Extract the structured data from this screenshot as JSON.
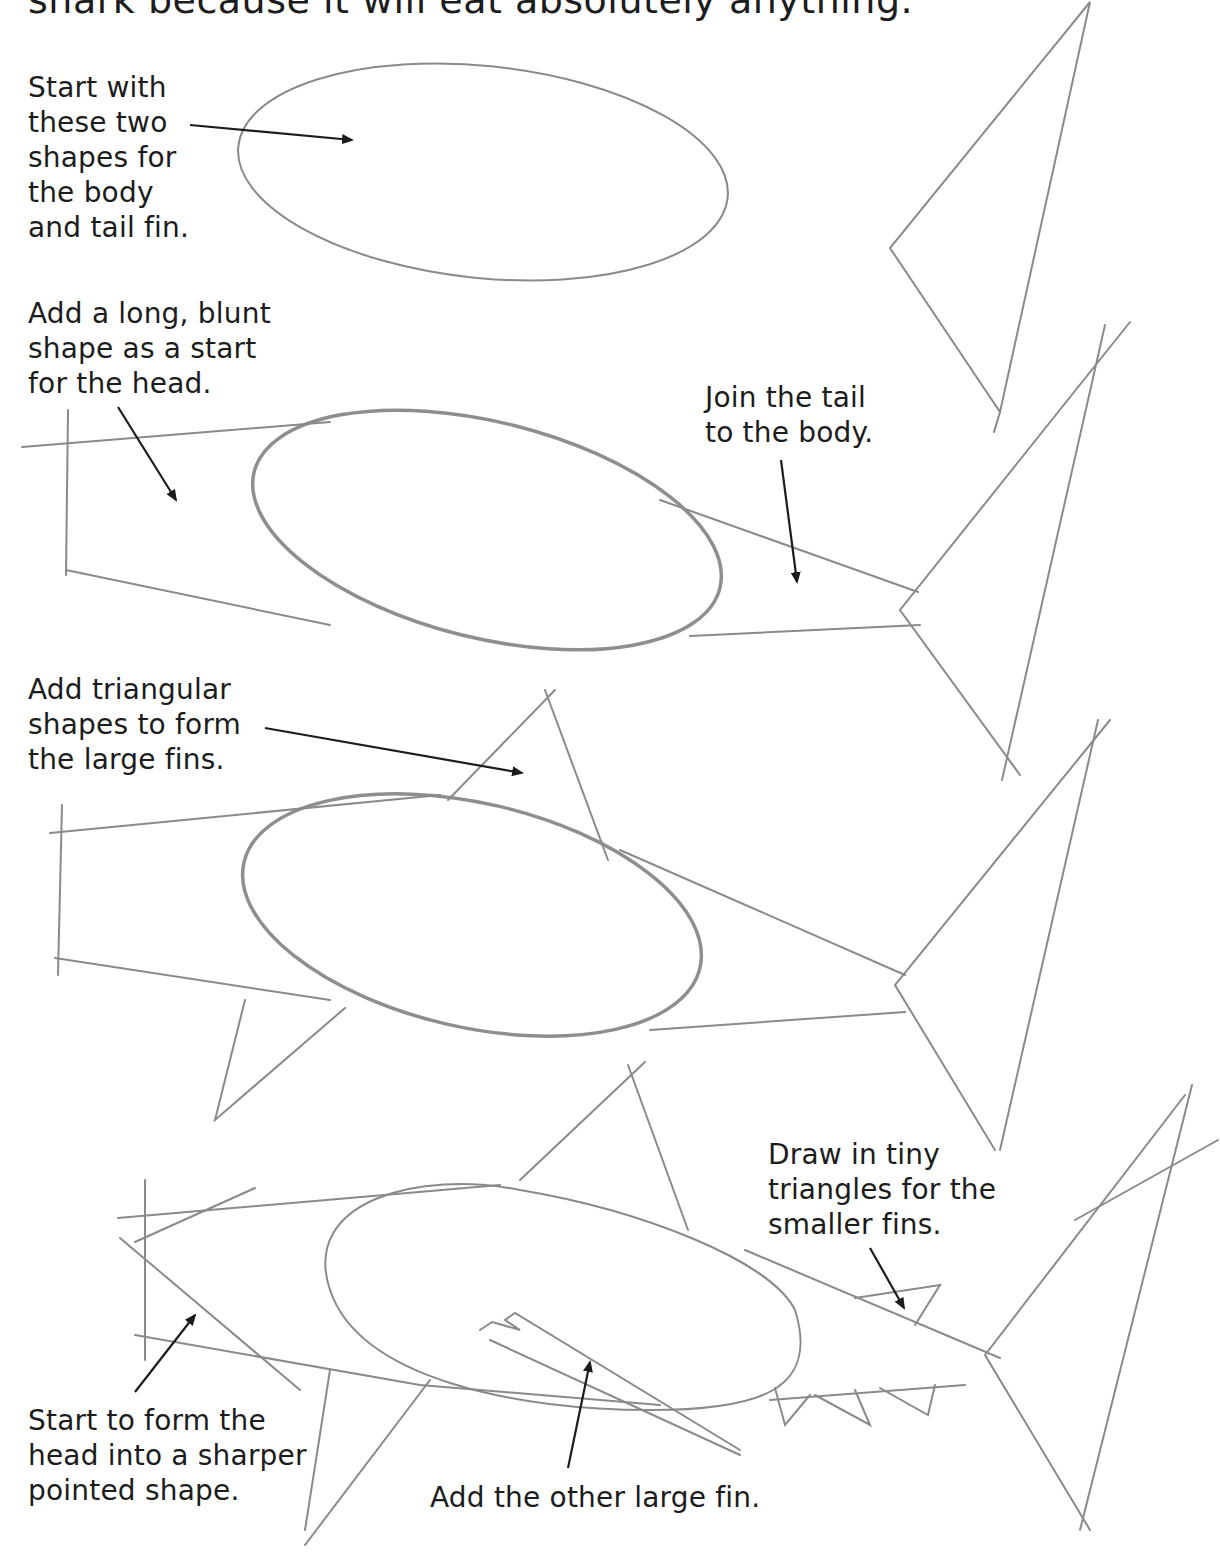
{
  "intro_text": "shark because it will eat absolutely anything.",
  "steps": [
    {
      "caption": "Start with\nthese two\nshapes for\nthe body\nand tail fin."
    },
    {
      "caption": "Add a long, blunt\nshape as a start\nfor the head."
    },
    {
      "caption": "Join the tail\nto the body."
    },
    {
      "caption": "Add triangular\nshapes to form\nthe large fins."
    },
    {
      "caption": "Draw in tiny\ntriangles for the\nsmaller fins."
    },
    {
      "caption": "Start to form the\nhead into a sharper\npointed shape."
    },
    {
      "caption": "Add the other large fin."
    }
  ],
  "colors": {
    "pencil": "#8a8a8a",
    "ink": "#1c1c1c",
    "background": "#ffffff"
  }
}
